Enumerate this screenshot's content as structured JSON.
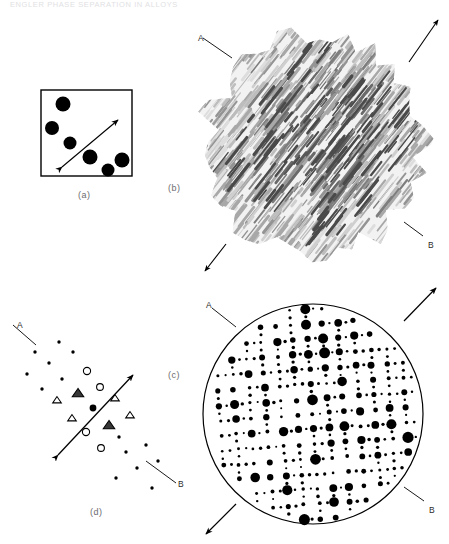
{
  "figure": {
    "header_text": "ENGLER   PHASE SEPARATION IN ALLOYS",
    "background": "#ffffff",
    "ink": "#000000",
    "panels": [
      {
        "id": "a",
        "label": "(a)",
        "label_x": 78,
        "label_y": 190,
        "caption_kind": "real-space-square",
        "type": "square-frame-with-precipitates"
      },
      {
        "id": "b",
        "label": "(b)",
        "label_x": 168,
        "label_y": 183,
        "caption_kind": "micrograph",
        "type": "mottled-streak-texture"
      },
      {
        "id": "c",
        "label": "(c)",
        "label_x": 168,
        "label_y": 370,
        "caption_kind": "diffraction-pattern",
        "type": "circular-spot-array"
      },
      {
        "id": "d",
        "label": "(d)",
        "label_x": 90,
        "label_y": 507,
        "caption_kind": "schematic-index",
        "type": "indexed-reciprocal-lattice"
      }
    ],
    "direction_labels": [
      {
        "text": "A",
        "panel": "b",
        "x": 198,
        "y": 33
      },
      {
        "text": "B",
        "panel": "b",
        "x": 428,
        "y": 240
      },
      {
        "text": "A",
        "panel": "c",
        "x": 206,
        "y": 300
      },
      {
        "text": "B",
        "panel": "c",
        "x": 429,
        "y": 505
      },
      {
        "text": "A",
        "panel": "d",
        "x": 17,
        "y": 320
      },
      {
        "text": "B",
        "panel": "d",
        "x": 178,
        "y": 479
      }
    ],
    "panel_a": {
      "frame": {
        "x": 41,
        "y": 90,
        "w": 91,
        "h": 86
      },
      "precipitates": [
        {
          "cx": 63,
          "cy": 104,
          "r": 7.5
        },
        {
          "cx": 52,
          "cy": 128,
          "r": 7.0
        },
        {
          "cx": 70,
          "cy": 143,
          "r": 6.5
        },
        {
          "cx": 90,
          "cy": 157,
          "r": 7.5
        },
        {
          "cx": 108,
          "cy": 170,
          "r": 6.5
        },
        {
          "cx": 122,
          "cy": 160,
          "r": 7.5
        }
      ],
      "double_arrow": {
        "x1": 62,
        "y1": 167,
        "x2": 118,
        "y2": 120
      }
    },
    "panel_b": {
      "center": {
        "cx": 314,
        "cy": 145
      },
      "radius": 118,
      "streak_angle_deg": -52,
      "arrows": [
        {
          "x1": 409,
          "y1": 62,
          "x2": 438,
          "y2": 20
        },
        {
          "x1": 226,
          "y1": 244,
          "x2": 205,
          "y2": 271
        }
      ],
      "leaders": [
        {
          "x1": 203,
          "y1": 38,
          "x2": 232,
          "y2": 58
        },
        {
          "x1": 423,
          "y1": 236,
          "x2": 404,
          "y2": 222
        }
      ]
    },
    "panel_c": {
      "circle": {
        "cx": 313,
        "cy": 414,
        "r": 110
      },
      "lattice": {
        "a_spacing": 15.5,
        "b_spacing": 15.0,
        "rotation_deg": -4
      },
      "arrows": [
        {
          "x1": 404,
          "y1": 321,
          "x2": 436,
          "y2": 288
        },
        {
          "x1": 236,
          "y1": 504,
          "x2": 206,
          "y2": 534
        }
      ],
      "leaders": [
        {
          "x1": 212,
          "y1": 308,
          "x2": 236,
          "y2": 327
        },
        {
          "x1": 424,
          "y1": 501,
          "x2": 404,
          "y2": 487
        }
      ]
    },
    "panel_d": {
      "origin": {
        "cx": 93,
        "cy": 408
      },
      "center_spot": {
        "cx": 93,
        "cy": 408,
        "r": 3.4
      },
      "double_arrow": {
        "x1": 58,
        "y1": 455,
        "x2": 133,
        "y2": 375
      },
      "leaders": [
        {
          "x1": 13,
          "y1": 325,
          "x2": 36,
          "y2": 345
        },
        {
          "x1": 146,
          "y1": 461,
          "x2": 176,
          "y2": 483
        }
      ],
      "open_circles": [
        {
          "cx": 87,
          "cy": 371,
          "r": 3.6
        },
        {
          "cx": 100,
          "cy": 387,
          "r": 3.4
        },
        {
          "cx": 86,
          "cy": 432,
          "r": 3.6
        },
        {
          "cx": 101,
          "cy": 448,
          "r": 3.4
        }
      ],
      "triangles": [
        {
          "cx": 57,
          "cy": 400,
          "size": 6,
          "shaded": false
        },
        {
          "cx": 72,
          "cy": 418,
          "size": 6,
          "shaded": false
        },
        {
          "cx": 115,
          "cy": 398,
          "size": 6,
          "shaded": false
        },
        {
          "cx": 130,
          "cy": 415,
          "size": 6,
          "shaded": false
        },
        {
          "cx": 78,
          "cy": 393,
          "size": 8,
          "shaded": true
        },
        {
          "cx": 109,
          "cy": 425,
          "size": 8,
          "shaded": true
        }
      ],
      "small_spots": [
        {
          "cx": 59,
          "cy": 342,
          "r": 1.7
        },
        {
          "cx": 35,
          "cy": 352,
          "r": 1.7
        },
        {
          "cx": 49,
          "cy": 363,
          "r": 1.7
        },
        {
          "cx": 27,
          "cy": 374,
          "r": 1.7
        },
        {
          "cx": 62,
          "cy": 379,
          "r": 1.7
        },
        {
          "cx": 42,
          "cy": 389,
          "r": 1.7
        },
        {
          "cx": 73,
          "cy": 352,
          "r": 1.7
        },
        {
          "cx": 119,
          "cy": 437,
          "r": 1.7
        },
        {
          "cx": 126,
          "cy": 452,
          "r": 1.7
        },
        {
          "cx": 146,
          "cy": 445,
          "r": 1.7
        },
        {
          "cx": 137,
          "cy": 468,
          "r": 1.7
        },
        {
          "cx": 158,
          "cy": 461,
          "r": 1.7
        },
        {
          "cx": 116,
          "cy": 478,
          "r": 1.7
        },
        {
          "cx": 152,
          "cy": 488,
          "r": 1.7
        }
      ]
    }
  }
}
